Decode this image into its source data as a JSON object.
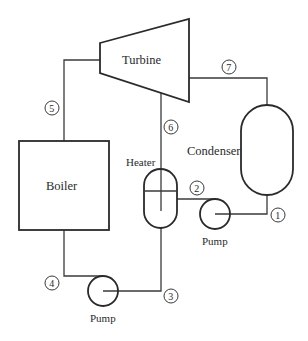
{
  "diagram": {
    "type": "Rankine cycle with open feedwater heater",
    "components": {
      "turbine": {
        "label": "Turbine"
      },
      "condenser": {
        "label": "Condenser"
      },
      "boiler": {
        "label": "Boiler"
      },
      "heater": {
        "label": "Heater"
      },
      "pump_condensate": {
        "label": "Pump"
      },
      "pump_feed": {
        "label": "Pump"
      }
    },
    "states": [
      {
        "id": "1",
        "label": "1"
      },
      {
        "id": "2",
        "label": "2"
      },
      {
        "id": "3",
        "label": "3"
      },
      {
        "id": "4",
        "label": "4"
      },
      {
        "id": "5",
        "label": "5"
      },
      {
        "id": "6",
        "label": "6"
      },
      {
        "id": "7",
        "label": "7"
      }
    ],
    "colors": {
      "line": "#3a3a3a",
      "background": "#ffffff"
    }
  }
}
